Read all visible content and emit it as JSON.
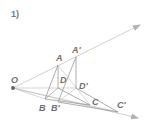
{
  "figure": {
    "number_label": "1)",
    "colors": {
      "line": "#b9b9b9",
      "dark_line": "#8c8c8c",
      "label": "#6f6f6f",
      "point": "#666666"
    },
    "points": {
      "O": {
        "label": "O",
        "x": 13,
        "y": 88
      },
      "A": {
        "label": "A",
        "x": 58,
        "y": 65
      },
      "A_prime": {
        "label": "A'",
        "x": 76,
        "y": 57
      },
      "D": {
        "label": "D",
        "x": 58,
        "y": 88
      },
      "D_prime": {
        "label": "D'",
        "x": 76,
        "y": 88
      },
      "B": {
        "label": "B",
        "x": 45,
        "y": 99
      },
      "B_prime": {
        "label": "B'",
        "x": 58,
        "y": 102
      },
      "C": {
        "label": "C",
        "x": 90,
        "y": 105
      },
      "C_prime": {
        "label": "C'",
        "x": 118,
        "y": 112
      }
    },
    "rays": [
      {
        "name": "ray-O-through-A",
        "from": "O",
        "to": [
          140,
          25
        ]
      },
      {
        "name": "ray-O-through-C",
        "from": "O",
        "to": [
          138,
          118
        ]
      }
    ]
  }
}
